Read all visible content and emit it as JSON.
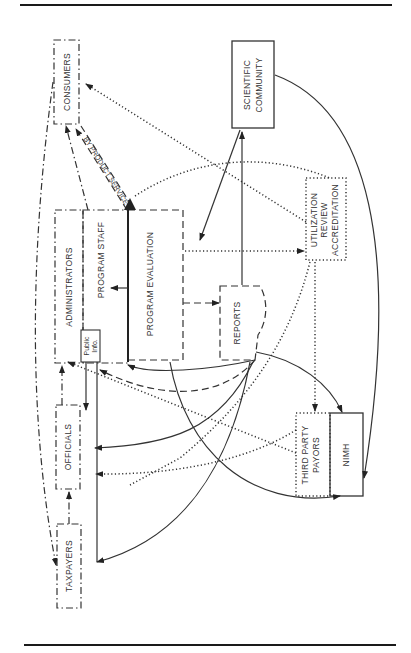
{
  "diagram": {
    "nodes": {
      "consumers": "CONSUMERS",
      "scientific_community_1": "SCIENTIFIC",
      "scientific_community_2": "COMMUNITY",
      "administrators": "ADMINISTRATORS",
      "program_staff": "PROGRAM STAFF",
      "program_evaluation": "PROGRAM EVALUATION",
      "public_info_1": "Public",
      "public_info_2": "Info.",
      "reports": "REPORTS",
      "utilization_1": "UTILIZATION",
      "utilization_2": "REVIEW",
      "utilization_3": "ACCREDITATION",
      "officials": "OFFICIALS",
      "taxpayers": "TAXPAYERS",
      "third_party_1": "THIRD PARTY",
      "third_party_2": "PAYORS",
      "nimh": "NIMH"
    },
    "edge_labels": {
      "by_product": "BY PRODUCT SERVICE"
    }
  }
}
